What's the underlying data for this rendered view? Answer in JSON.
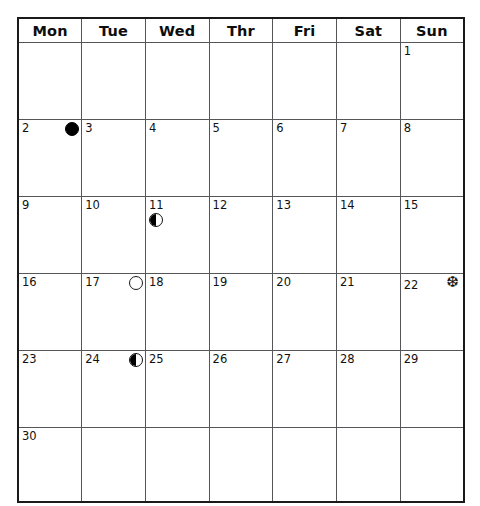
{
  "calendar": {
    "weekday_headers": [
      "Mon",
      "Tue",
      "Wed",
      "Thr",
      "Fri",
      "Sat",
      "Sun"
    ],
    "weeks": [
      [
        {
          "day": ""
        },
        {
          "day": ""
        },
        {
          "day": ""
        },
        {
          "day": ""
        },
        {
          "day": ""
        },
        {
          "day": ""
        },
        {
          "day": "1"
        }
      ],
      [
        {
          "day": "2",
          "marker": "new-moon",
          "marker_position": "right"
        },
        {
          "day": "3"
        },
        {
          "day": "4"
        },
        {
          "day": "5"
        },
        {
          "day": "6"
        },
        {
          "day": "7"
        },
        {
          "day": "8"
        }
      ],
      [
        {
          "day": "9"
        },
        {
          "day": "10"
        },
        {
          "day": "11",
          "marker": "first-quarter-moon",
          "marker_position": "below"
        },
        {
          "day": "12"
        },
        {
          "day": "13"
        },
        {
          "day": "14"
        },
        {
          "day": "15"
        }
      ],
      [
        {
          "day": "16"
        },
        {
          "day": "17",
          "marker": "full-moon",
          "marker_position": "right"
        },
        {
          "day": "18"
        },
        {
          "day": "19"
        },
        {
          "day": "20"
        },
        {
          "day": "21"
        },
        {
          "day": "22",
          "marker": "snowflake",
          "marker_position": "right",
          "glyph": "❆"
        }
      ],
      [
        {
          "day": "23"
        },
        {
          "day": "24",
          "marker": "last-quarter-moon",
          "marker_position": "right"
        },
        {
          "day": "25"
        },
        {
          "day": "26"
        },
        {
          "day": "27"
        },
        {
          "day": "28"
        },
        {
          "day": "29"
        }
      ],
      [
        {
          "day": "30"
        },
        {
          "day": ""
        },
        {
          "day": ""
        },
        {
          "day": ""
        },
        {
          "day": ""
        },
        {
          "day": ""
        },
        {
          "day": ""
        }
      ]
    ],
    "colors": {
      "outer_border": "#1a1a1a",
      "grid_line": "#55565a",
      "text": "#111111",
      "background": "#ffffff",
      "moon_fill": "#000000"
    }
  }
}
